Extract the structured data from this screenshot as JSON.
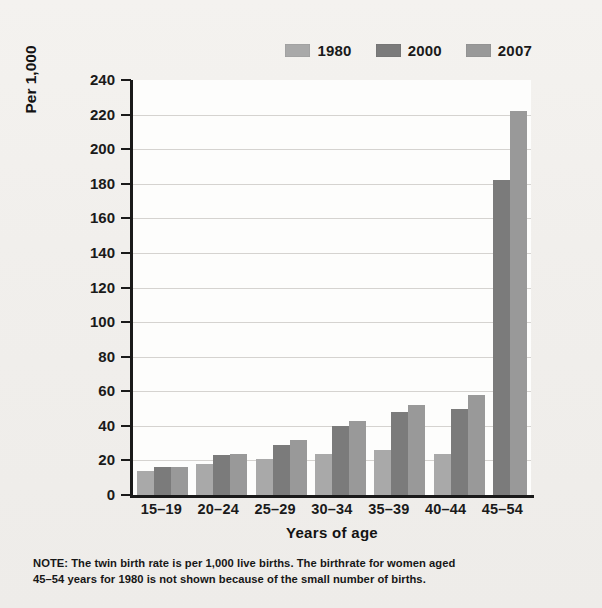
{
  "legend": {
    "items": [
      {
        "label": "1980",
        "color": "#a9a9a9",
        "name": "legend-item-1980"
      },
      {
        "label": "2000",
        "color": "#7b7b7b",
        "name": "legend-item-2000"
      },
      {
        "label": "2007",
        "color": "#999999",
        "name": "legend-item-2007"
      }
    ]
  },
  "axes": {
    "ylabel": "Per 1,000",
    "xlabel": "Years of age",
    "yticks": [
      "240",
      "220",
      "200",
      "180",
      "160",
      "140",
      "120",
      "100",
      "80",
      "60",
      "40",
      "20",
      "0"
    ]
  },
  "note": {
    "line1": "NOTE: The twin birth rate is per 1,000 live births. The birthrate for women aged",
    "line2": "45–54 years for 1980 is not shown because of the small number of births."
  },
  "chart_data": {
    "type": "bar",
    "title": "",
    "xlabel": "Years of age",
    "ylabel": "Per 1,000",
    "ylim": [
      0,
      240
    ],
    "ytick_step": 20,
    "grid": true,
    "legend_position": "top-right",
    "categories": [
      "15–19",
      "20–24",
      "25–29",
      "30–34",
      "35–39",
      "40–44",
      "45–54"
    ],
    "series": [
      {
        "name": "1980",
        "color": "#a9a9a9",
        "values": [
          14,
          18,
          21,
          24,
          26,
          24,
          null
        ]
      },
      {
        "name": "2000",
        "color": "#7b7b7b",
        "values": [
          16,
          23,
          29,
          40,
          48,
          50,
          182
        ]
      },
      {
        "name": "2007",
        "color": "#999999",
        "values": [
          16,
          24,
          32,
          43,
          52,
          58,
          222
        ]
      }
    ]
  }
}
